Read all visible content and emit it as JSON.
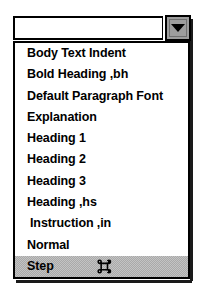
{
  "widget": {
    "type": "combo-box-dropdown",
    "title": "Style name combo box with open dropdown list"
  },
  "combo": {
    "input_value": "",
    "input_placeholder": "",
    "dropdown_button_label": "",
    "arrow_icon": "triangle-down-icon"
  },
  "list": {
    "selected_index": 10,
    "items": [
      {
        "label": "Body Text Indent",
        "indented": false,
        "selected": false,
        "badge": ""
      },
      {
        "label": "Bold Heading ,bh",
        "indented": false,
        "selected": false,
        "badge": ""
      },
      {
        "label": "Default Paragraph Font",
        "indented": false,
        "selected": false,
        "badge": ""
      },
      {
        "label": "Explanation",
        "indented": false,
        "selected": false,
        "badge": ""
      },
      {
        "label": "Heading 1",
        "indented": false,
        "selected": false,
        "badge": ""
      },
      {
        "label": "Heading 2",
        "indented": false,
        "selected": false,
        "badge": ""
      },
      {
        "label": "Heading 3",
        "indented": false,
        "selected": false,
        "badge": ""
      },
      {
        "label": "Heading ,hs",
        "indented": false,
        "selected": false,
        "badge": ""
      },
      {
        "label": "Instruction ,in",
        "indented": true,
        "selected": false,
        "badge": ""
      },
      {
        "label": "Normal",
        "indented": false,
        "selected": false,
        "badge": ""
      },
      {
        "label": "Step",
        "indented": false,
        "selected": true,
        "badge": "command-key-icon"
      }
    ]
  },
  "colors": {
    "border": "#000000",
    "list_background": "#ffffff",
    "selection_gray": "#a9a9a9",
    "button_face": "#9d9d9d",
    "text": "#000000"
  }
}
